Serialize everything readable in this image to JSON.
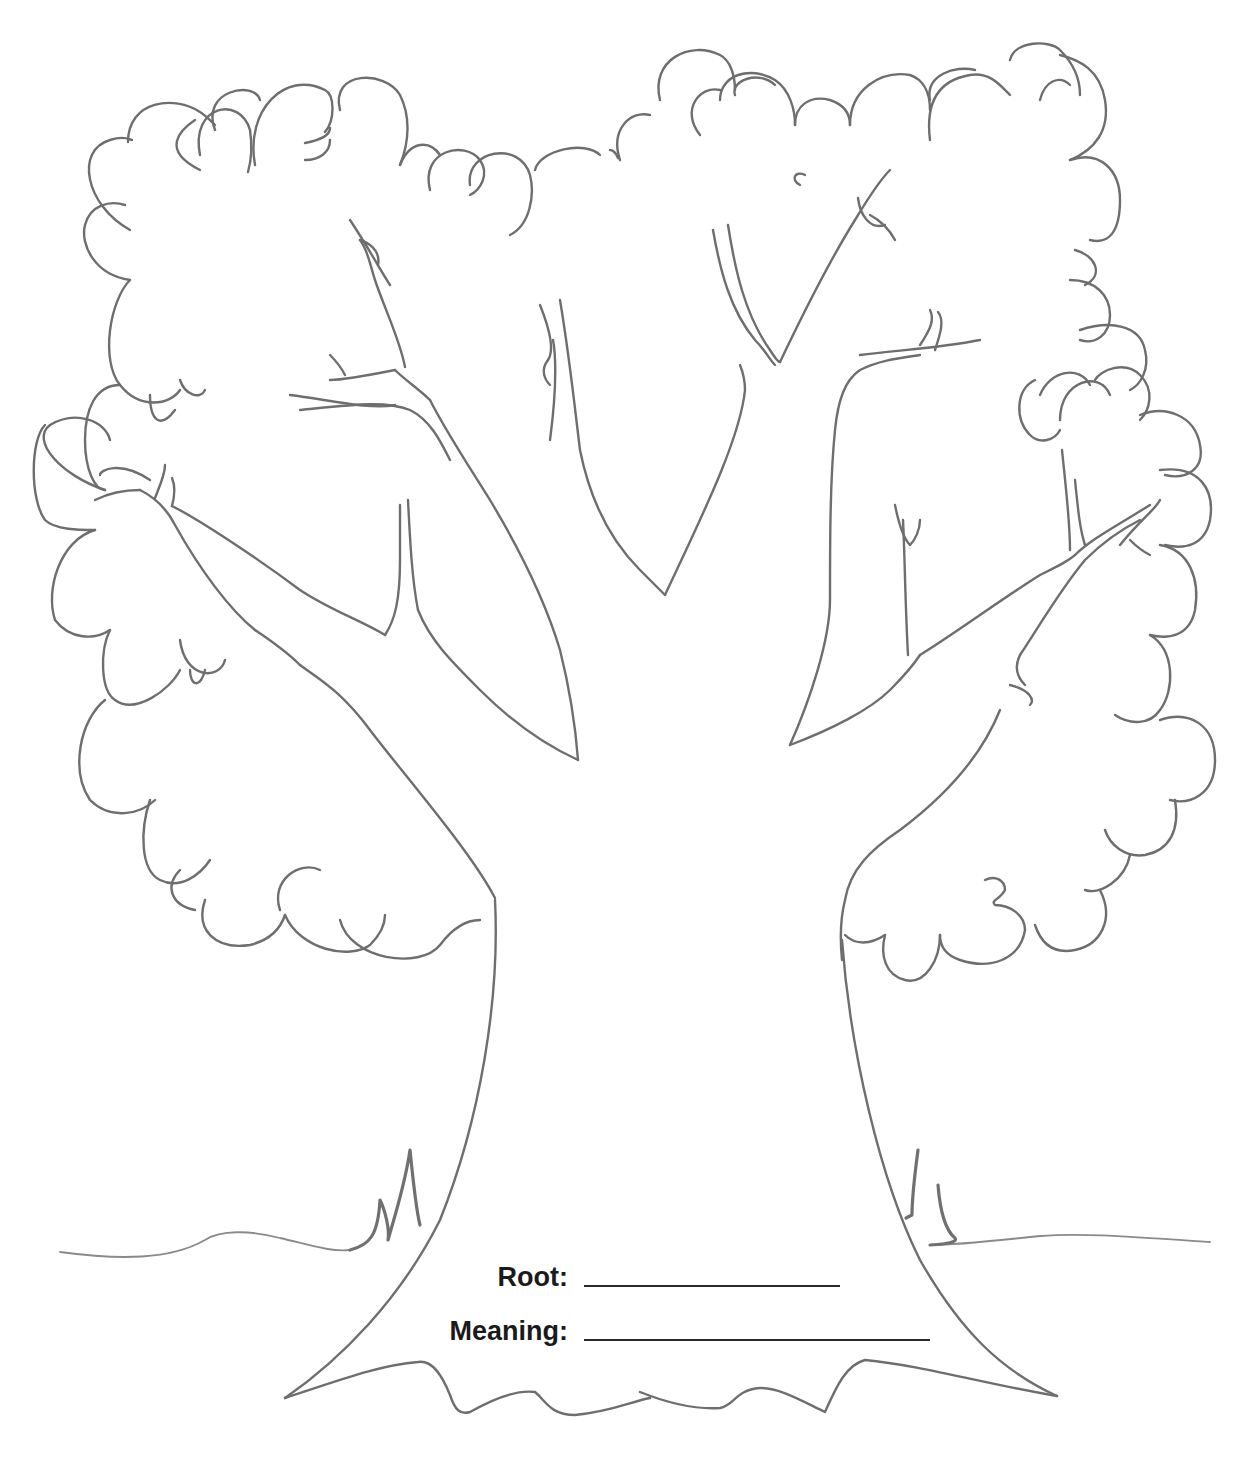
{
  "worksheet": {
    "illustration": "tree-outline",
    "fields": [
      {
        "label": "Root:",
        "value": ""
      },
      {
        "label": "Meaning:",
        "value": ""
      }
    ]
  },
  "colors": {
    "stroke": "#6e6e6e",
    "text": "#1a1a1a",
    "background": "#ffffff"
  }
}
